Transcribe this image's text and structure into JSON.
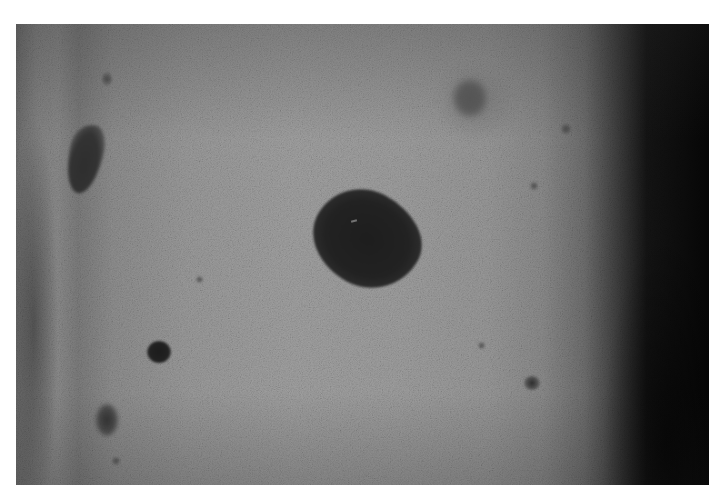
{
  "image": {
    "subject": "grayscale clinical photograph of skin with pigmented lesions",
    "colors": {
      "frame": "#ffffff",
      "skin_mid": "#9e9e9e",
      "shadow_edge": "#060606",
      "lesion": "#1e1e1e"
    },
    "lesions": [
      {
        "name": "large-irregular-lesion",
        "position": "center"
      },
      {
        "name": "teardrop-lesion",
        "position": "upper-left"
      },
      {
        "name": "small-round-dark-spot",
        "position": "lower-left"
      },
      {
        "name": "faint-lesion",
        "position": "bottom-left edge"
      },
      {
        "name": "faint-halo-lesion",
        "position": "upper-right"
      },
      {
        "name": "small-dark-spot",
        "position": "lower-right"
      }
    ]
  }
}
